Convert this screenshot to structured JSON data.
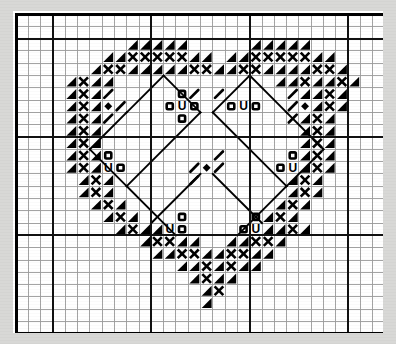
{
  "document": {
    "kind": "cross-stitch-pattern-chart",
    "title": "Heart Pattern Chart",
    "background_color": "#d8d8d6",
    "paper_color": "#ffffff",
    "ink_color": "#000000",
    "thin_grid_color": "#9a9a9a",
    "thick_grid_color": "#111111"
  },
  "chart_data": {
    "type": "heatmap",
    "title": "Heart Pattern Chart",
    "subtitle": "",
    "xlabel": "",
    "ylabel": "",
    "grid": true,
    "legend_position": "none",
    "columns": 30,
    "rows": 26,
    "cell_size": 12.3,
    "block_every": 8,
    "origin_x": 3,
    "origin_y": 2,
    "symbol_key": [
      {
        "code": "tl",
        "name": "triangle-top-left",
        "label": "Filled triangle, top-left corner"
      },
      {
        "code": "tr",
        "name": "triangle-top-right",
        "label": "Filled triangle, top-right corner"
      },
      {
        "code": "bl",
        "name": "triangle-bottom-left",
        "label": "Filled triangle, bottom-left corner"
      },
      {
        "code": "br",
        "name": "triangle-bottom-right",
        "label": "Filled triangle, bottom-right corner"
      },
      {
        "code": "x",
        "name": "cross-x",
        "label": "Bold X cross stitch"
      },
      {
        "code": "o",
        "name": "circle-o",
        "label": "Open circle bead"
      },
      {
        "code": "U",
        "name": "letter-u",
        "label": "Letter U symbol"
      },
      {
        "code": "d",
        "name": "diamond",
        "label": "Filled diamond"
      },
      {
        "code": "s",
        "name": "slash-right",
        "label": "Forward slash stitch"
      },
      {
        "code": "z",
        "name": "slash-left",
        "label": "Back slash stitch"
      }
    ],
    "cells": [
      {
        "c": 9,
        "r": 2,
        "s": "tr"
      },
      {
        "c": 10,
        "r": 2,
        "s": "tr"
      },
      {
        "c": 11,
        "r": 2,
        "s": "tr"
      },
      {
        "c": 12,
        "r": 2,
        "s": "tr"
      },
      {
        "c": 13,
        "r": 2,
        "s": "tr"
      },
      {
        "c": 19,
        "r": 2,
        "s": "tr"
      },
      {
        "c": 20,
        "r": 2,
        "s": "tr"
      },
      {
        "c": 21,
        "r": 2,
        "s": "tr"
      },
      {
        "c": 22,
        "r": 2,
        "s": "tr"
      },
      {
        "c": 23,
        "r": 2,
        "s": "tr"
      },
      {
        "c": 7,
        "r": 3,
        "s": "tr"
      },
      {
        "c": 8,
        "r": 3,
        "s": "tr"
      },
      {
        "c": 9,
        "r": 3,
        "s": "x"
      },
      {
        "c": 10,
        "r": 3,
        "s": "x"
      },
      {
        "c": 11,
        "r": 3,
        "s": "x"
      },
      {
        "c": 12,
        "r": 3,
        "s": "x"
      },
      {
        "c": 13,
        "r": 3,
        "s": "x"
      },
      {
        "c": 14,
        "r": 3,
        "s": "tr"
      },
      {
        "c": 15,
        "r": 3,
        "s": "tr"
      },
      {
        "c": 17,
        "r": 3,
        "s": "tr"
      },
      {
        "c": 18,
        "r": 3,
        "s": "tr"
      },
      {
        "c": 19,
        "r": 3,
        "s": "x"
      },
      {
        "c": 20,
        "r": 3,
        "s": "x"
      },
      {
        "c": 21,
        "r": 3,
        "s": "x"
      },
      {
        "c": 22,
        "r": 3,
        "s": "x"
      },
      {
        "c": 23,
        "r": 3,
        "s": "x"
      },
      {
        "c": 24,
        "r": 3,
        "s": "tr"
      },
      {
        "c": 25,
        "r": 3,
        "s": "tr"
      },
      {
        "c": 6,
        "r": 4,
        "s": "tr"
      },
      {
        "c": 7,
        "r": 4,
        "s": "x"
      },
      {
        "c": 8,
        "r": 4,
        "s": "x"
      },
      {
        "c": 9,
        "r": 4,
        "s": "tr"
      },
      {
        "c": 10,
        "r": 4,
        "s": "tr"
      },
      {
        "c": 11,
        "r": 4,
        "s": "tr"
      },
      {
        "c": 12,
        "r": 4,
        "s": "tr"
      },
      {
        "c": 13,
        "r": 4,
        "s": "tr"
      },
      {
        "c": 14,
        "r": 4,
        "s": "x"
      },
      {
        "c": 15,
        "r": 4,
        "s": "x"
      },
      {
        "c": 16,
        "r": 4,
        "s": "tr"
      },
      {
        "c": 16,
        "r": 4,
        "s": "tr"
      },
      {
        "c": 17,
        "r": 4,
        "s": "tr"
      },
      {
        "c": 18,
        "r": 4,
        "s": "x"
      },
      {
        "c": 19,
        "r": 4,
        "s": "x"
      },
      {
        "c": 20,
        "r": 4,
        "s": "tr"
      },
      {
        "c": 21,
        "r": 4,
        "s": "tr"
      },
      {
        "c": 22,
        "r": 4,
        "s": "tr"
      },
      {
        "c": 23,
        "r": 4,
        "s": "tr"
      },
      {
        "c": 24,
        "r": 4,
        "s": "x"
      },
      {
        "c": 25,
        "r": 4,
        "s": "x"
      },
      {
        "c": 26,
        "r": 4,
        "s": "tr"
      },
      {
        "c": 4,
        "r": 5,
        "s": "tr"
      },
      {
        "c": 5,
        "r": 5,
        "s": "x"
      },
      {
        "c": 6,
        "r": 5,
        "s": "tr"
      },
      {
        "c": 7,
        "r": 5,
        "s": "tr"
      },
      {
        "c": 21,
        "r": 5,
        "s": "tr"
      },
      {
        "c": 22,
        "r": 5,
        "s": "tr"
      },
      {
        "c": 23,
        "r": 5,
        "s": "x"
      },
      {
        "c": 24,
        "r": 5,
        "s": "tr"
      },
      {
        "c": 25,
        "r": 5,
        "s": "tr"
      },
      {
        "c": 26,
        "r": 5,
        "s": "x"
      },
      {
        "c": 27,
        "r": 5,
        "s": "tr"
      },
      {
        "c": 4,
        "r": 6,
        "s": "tr"
      },
      {
        "c": 5,
        "r": 6,
        "s": "x"
      },
      {
        "c": 6,
        "r": 6,
        "s": "tr"
      },
      {
        "c": 7,
        "r": 6,
        "s": "s"
      },
      {
        "c": 13,
        "r": 6,
        "s": "o"
      },
      {
        "c": 14,
        "r": 6,
        "s": "s"
      },
      {
        "c": 16,
        "r": 6,
        "s": "s"
      },
      {
        "c": 22,
        "r": 6,
        "s": "s"
      },
      {
        "c": 23,
        "r": 6,
        "s": "tr"
      },
      {
        "c": 24,
        "r": 6,
        "s": "tr"
      },
      {
        "c": 25,
        "r": 6,
        "s": "x"
      },
      {
        "c": 26,
        "r": 6,
        "s": "tr"
      },
      {
        "c": 4,
        "r": 7,
        "s": "tr"
      },
      {
        "c": 5,
        "r": 7,
        "s": "x"
      },
      {
        "c": 6,
        "r": 7,
        "s": "tr"
      },
      {
        "c": 7,
        "r": 7,
        "s": "d"
      },
      {
        "c": 8,
        "r": 7,
        "s": "s"
      },
      {
        "c": 12,
        "r": 7,
        "s": "o"
      },
      {
        "c": 13,
        "r": 7,
        "s": "U"
      },
      {
        "c": 14,
        "r": 7,
        "s": "o"
      },
      {
        "c": 17,
        "r": 7,
        "s": "o"
      },
      {
        "c": 18,
        "r": 7,
        "s": "U"
      },
      {
        "c": 19,
        "r": 7,
        "s": "o"
      },
      {
        "c": 22,
        "r": 7,
        "s": "s"
      },
      {
        "c": 23,
        "r": 7,
        "s": "d"
      },
      {
        "c": 24,
        "r": 7,
        "s": "tr"
      },
      {
        "c": 25,
        "r": 7,
        "s": "x"
      },
      {
        "c": 26,
        "r": 7,
        "s": "tr"
      },
      {
        "c": 4,
        "r": 8,
        "s": "tr"
      },
      {
        "c": 5,
        "r": 8,
        "s": "x"
      },
      {
        "c": 6,
        "r": 8,
        "s": "tr"
      },
      {
        "c": 7,
        "r": 8,
        "s": "s"
      },
      {
        "c": 13,
        "r": 8,
        "s": "o"
      },
      {
        "c": 22,
        "r": 8,
        "s": "s"
      },
      {
        "c": 23,
        "r": 8,
        "s": "tr"
      },
      {
        "c": 24,
        "r": 8,
        "s": "x"
      },
      {
        "c": 25,
        "r": 8,
        "s": "tr"
      },
      {
        "c": 4,
        "r": 9,
        "s": "tr"
      },
      {
        "c": 5,
        "r": 9,
        "s": "x"
      },
      {
        "c": 6,
        "r": 9,
        "s": "tr"
      },
      {
        "c": 23,
        "r": 9,
        "s": "tr"
      },
      {
        "c": 24,
        "r": 9,
        "s": "x"
      },
      {
        "c": 25,
        "r": 9,
        "s": "tr"
      },
      {
        "c": 4,
        "r": 10,
        "s": "tr"
      },
      {
        "c": 5,
        "r": 10,
        "s": "x"
      },
      {
        "c": 6,
        "r": 10,
        "s": "tr"
      },
      {
        "c": 23,
        "r": 10,
        "s": "tr"
      },
      {
        "c": 24,
        "r": 10,
        "s": "x"
      },
      {
        "c": 25,
        "r": 10,
        "s": "tr"
      },
      {
        "c": 4,
        "r": 11,
        "s": "tr"
      },
      {
        "c": 5,
        "r": 11,
        "s": "x"
      },
      {
        "c": 6,
        "r": 11,
        "s": "tr"
      },
      {
        "c": 7,
        "r": 11,
        "s": "o"
      },
      {
        "c": 16,
        "r": 11,
        "s": "s"
      },
      {
        "c": 22,
        "r": 11,
        "s": "o"
      },
      {
        "c": 23,
        "r": 11,
        "s": "tr"
      },
      {
        "c": 24,
        "r": 11,
        "s": "x"
      },
      {
        "c": 25,
        "r": 11,
        "s": "tr"
      },
      {
        "c": 4,
        "r": 12,
        "s": "tr"
      },
      {
        "c": 5,
        "r": 12,
        "s": "x"
      },
      {
        "c": 6,
        "r": 12,
        "s": "tr"
      },
      {
        "c": 7,
        "r": 12,
        "s": "U"
      },
      {
        "c": 8,
        "r": 12,
        "s": "o"
      },
      {
        "c": 14,
        "r": 12,
        "s": "s"
      },
      {
        "c": 15,
        "r": 12,
        "s": "d"
      },
      {
        "c": 16,
        "r": 12,
        "s": "s"
      },
      {
        "c": 21,
        "r": 12,
        "s": "o"
      },
      {
        "c": 22,
        "r": 12,
        "s": "U"
      },
      {
        "c": 23,
        "r": 12,
        "s": "tr"
      },
      {
        "c": 24,
        "r": 12,
        "s": "x"
      },
      {
        "c": 25,
        "r": 12,
        "s": "tr"
      },
      {
        "c": 5,
        "r": 13,
        "s": "tr"
      },
      {
        "c": 6,
        "r": 13,
        "s": "x"
      },
      {
        "c": 7,
        "r": 13,
        "s": "tr"
      },
      {
        "c": 14,
        "r": 13,
        "s": "s"
      },
      {
        "c": 22,
        "r": 13,
        "s": "tr"
      },
      {
        "c": 23,
        "r": 13,
        "s": "x"
      },
      {
        "c": 24,
        "r": 13,
        "s": "tr"
      },
      {
        "c": 5,
        "r": 14,
        "s": "tr"
      },
      {
        "c": 6,
        "r": 14,
        "s": "x"
      },
      {
        "c": 7,
        "r": 14,
        "s": "tr"
      },
      {
        "c": 22,
        "r": 14,
        "s": "tr"
      },
      {
        "c": 23,
        "r": 14,
        "s": "x"
      },
      {
        "c": 24,
        "r": 14,
        "s": "tr"
      },
      {
        "c": 6,
        "r": 15,
        "s": "tr"
      },
      {
        "c": 7,
        "r": 15,
        "s": "x"
      },
      {
        "c": 8,
        "r": 15,
        "s": "tr"
      },
      {
        "c": 21,
        "r": 15,
        "s": "tr"
      },
      {
        "c": 22,
        "r": 15,
        "s": "x"
      },
      {
        "c": 23,
        "r": 15,
        "s": "tr"
      },
      {
        "c": 7,
        "r": 16,
        "s": "tr"
      },
      {
        "c": 8,
        "r": 16,
        "s": "x"
      },
      {
        "c": 9,
        "r": 16,
        "s": "tr"
      },
      {
        "c": 13,
        "r": 16,
        "s": "o"
      },
      {
        "c": 19,
        "r": 16,
        "s": "o"
      },
      {
        "c": 20,
        "r": 16,
        "s": "tr"
      },
      {
        "c": 21,
        "r": 16,
        "s": "x"
      },
      {
        "c": 22,
        "r": 16,
        "s": "tr"
      },
      {
        "c": 8,
        "r": 17,
        "s": "tr"
      },
      {
        "c": 9,
        "r": 17,
        "s": "x"
      },
      {
        "c": 10,
        "r": 17,
        "s": "tr"
      },
      {
        "c": 11,
        "r": 17,
        "s": "tr"
      },
      {
        "c": 12,
        "r": 17,
        "s": "U"
      },
      {
        "c": 13,
        "r": 17,
        "s": "o"
      },
      {
        "c": 18,
        "r": 17,
        "s": "o"
      },
      {
        "c": 19,
        "r": 17,
        "s": "U"
      },
      {
        "c": 20,
        "r": 17,
        "s": "tr"
      },
      {
        "c": 21,
        "r": 17,
        "s": "tr"
      },
      {
        "c": 22,
        "r": 17,
        "s": "x"
      },
      {
        "c": 23,
        "r": 17,
        "s": "tr"
      },
      {
        "c": 10,
        "r": 18,
        "s": "tr"
      },
      {
        "c": 11,
        "r": 18,
        "s": "x"
      },
      {
        "c": 12,
        "r": 18,
        "s": "x"
      },
      {
        "c": 13,
        "r": 18,
        "s": "tr"
      },
      {
        "c": 14,
        "r": 18,
        "s": "tr"
      },
      {
        "c": 17,
        "r": 18,
        "s": "tr"
      },
      {
        "c": 18,
        "r": 18,
        "s": "tr"
      },
      {
        "c": 19,
        "r": 18,
        "s": "x"
      },
      {
        "c": 20,
        "r": 18,
        "s": "x"
      },
      {
        "c": 21,
        "r": 18,
        "s": "tr"
      },
      {
        "c": 11,
        "r": 19,
        "s": "tr"
      },
      {
        "c": 12,
        "r": 19,
        "s": "tr"
      },
      {
        "c": 13,
        "r": 19,
        "s": "x"
      },
      {
        "c": 14,
        "r": 19,
        "s": "x"
      },
      {
        "c": 15,
        "r": 19,
        "s": "tr"
      },
      {
        "c": 16,
        "r": 19,
        "s": "tr"
      },
      {
        "c": 17,
        "r": 19,
        "s": "x"
      },
      {
        "c": 18,
        "r": 19,
        "s": "x"
      },
      {
        "c": 19,
        "r": 19,
        "s": "tr"
      },
      {
        "c": 20,
        "r": 19,
        "s": "tr"
      },
      {
        "c": 13,
        "r": 20,
        "s": "tr"
      },
      {
        "c": 14,
        "r": 20,
        "s": "tr"
      },
      {
        "c": 15,
        "r": 20,
        "s": "x"
      },
      {
        "c": 16,
        "r": 20,
        "s": "tr"
      },
      {
        "c": 17,
        "r": 20,
        "s": "x"
      },
      {
        "c": 18,
        "r": 20,
        "s": "tr"
      },
      {
        "c": 19,
        "r": 20,
        "s": "tr"
      },
      {
        "c": 14,
        "r": 21,
        "s": "tr"
      },
      {
        "c": 15,
        "r": 21,
        "s": "x"
      },
      {
        "c": 16,
        "r": 21,
        "s": "tr"
      },
      {
        "c": 17,
        "r": 21,
        "s": "tr"
      },
      {
        "c": 15,
        "r": 22,
        "s": "tr"
      },
      {
        "c": 16,
        "r": 22,
        "s": "x"
      },
      {
        "c": 15,
        "r": 23,
        "s": "tr"
      }
    ],
    "backstitch_lines": [
      {
        "x1": 15,
        "y1": 8,
        "x2": 12,
        "y2": 5
      },
      {
        "x1": 12,
        "y1": 5,
        "x2": 9,
        "y2": 8
      },
      {
        "x1": 16,
        "y1": 8,
        "x2": 19,
        "y2": 5
      },
      {
        "x1": 19,
        "y1": 5,
        "x2": 22,
        "y2": 8
      },
      {
        "x1": 9,
        "y1": 8,
        "x2": 6,
        "y2": 11
      },
      {
        "x1": 22,
        "y1": 8,
        "x2": 25,
        "y2": 11
      },
      {
        "x1": 6,
        "y1": 11,
        "x2": 9,
        "y2": 14
      },
      {
        "x1": 25,
        "y1": 11,
        "x2": 22,
        "y2": 14
      },
      {
        "x1": 15,
        "y1": 8,
        "x2": 9,
        "y2": 14
      },
      {
        "x1": 16,
        "y1": 8,
        "x2": 22,
        "y2": 14
      },
      {
        "x1": 9,
        "y1": 14,
        "x2": 13,
        "y2": 18
      },
      {
        "x1": 22,
        "y1": 14,
        "x2": 18,
        "y2": 18
      },
      {
        "x1": 15,
        "y1": 13,
        "x2": 11,
        "y2": 17
      },
      {
        "x1": 16,
        "y1": 13,
        "x2": 20,
        "y2": 17
      }
    ]
  }
}
